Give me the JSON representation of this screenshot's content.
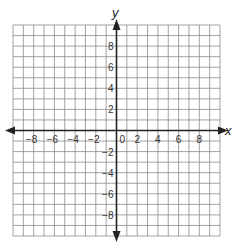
{
  "chart_data": {
    "type": "coordinate-grid",
    "title": "",
    "xlabel": "x",
    "ylabel": "y",
    "xlim": [
      -10,
      10
    ],
    "ylim": [
      -10,
      10
    ],
    "grid": true,
    "grid_step": 1,
    "x_ticks": [
      -8,
      -6,
      -4,
      -2,
      0,
      2,
      4,
      6,
      8
    ],
    "x_tick_labels": [
      "−8",
      "−6",
      "−4",
      "−2",
      "0",
      "2",
      "4",
      "6",
      "8"
    ],
    "y_ticks": [
      8,
      6,
      4,
      2,
      -2,
      -4,
      -6,
      -8
    ],
    "y_tick_labels": [
      "8",
      "6",
      "4",
      "2",
      "−2",
      "−4",
      "−6",
      "−8"
    ],
    "series": [],
    "axes_arrows": true
  },
  "colors": {
    "grid": "#8a8a8a",
    "axis": "#222222",
    "background": "#ffffff"
  }
}
